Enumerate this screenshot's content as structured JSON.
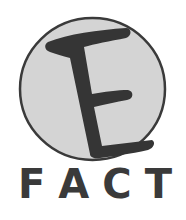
{
  "logo": {
    "emblem_letter": "E",
    "wordmark": "FACT",
    "wordmark_letters": [
      "F",
      "A",
      "C",
      "T"
    ],
    "colors": {
      "background": "#ffffff",
      "circle_fill": "#d4d4d4",
      "circle_stroke": "#3a3a3a",
      "letter": "#353535",
      "wordmark": "#3a3a3a"
    }
  }
}
